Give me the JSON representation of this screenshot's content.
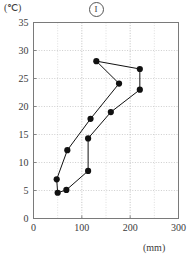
{
  "chart_data": {
    "type": "line",
    "title": "①",
    "title_kind": "circled-numeral-one",
    "xlabel": "(mm)",
    "ylabel": "(℃)",
    "xlim": [
      0,
      300
    ],
    "ylim": [
      0,
      35
    ],
    "x_ticks": [
      0,
      100,
      200,
      300
    ],
    "y_ticks": [
      0,
      5,
      10,
      15,
      20,
      25,
      30,
      35
    ],
    "x_tick_labels": [
      "0",
      "100",
      "200",
      "300"
    ],
    "y_tick_labels": [
      "0",
      "5",
      "10",
      "15",
      "20",
      "25",
      "30",
      "35"
    ],
    "x_minor_step": 50,
    "grid": true,
    "grid_style": "dotted",
    "legend": null,
    "closed_loop": true,
    "marker": "filled-circle",
    "series": [
      {
        "name": "hythergraph",
        "points": [
          {
            "x": 50,
            "y": 4.6
          },
          {
            "x": 68,
            "y": 5.1
          },
          {
            "x": 113,
            "y": 8.5
          },
          {
            "x": 113,
            "y": 14.3
          },
          {
            "x": 160,
            "y": 19.0
          },
          {
            "x": 220,
            "y": 23.0
          },
          {
            "x": 220,
            "y": 26.7
          },
          {
            "x": 130,
            "y": 28.1
          },
          {
            "x": 177,
            "y": 24.1
          },
          {
            "x": 118,
            "y": 17.8
          },
          {
            "x": 70,
            "y": 12.2
          },
          {
            "x": 48,
            "y": 7.0
          }
        ]
      }
    ]
  },
  "axes": {
    "unit_y_label": "(℃)",
    "unit_x_label": "(mm)"
  }
}
